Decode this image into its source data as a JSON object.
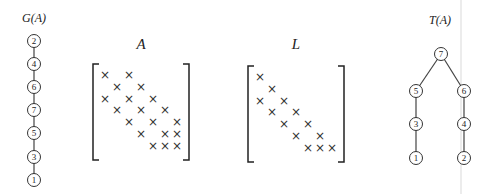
{
  "graph_g": {
    "title": "G(A)",
    "nodes": [
      {
        "id": "2",
        "x": 34,
        "y": 41
      },
      {
        "id": "4",
        "x": 34,
        "y": 64
      },
      {
        "id": "6",
        "x": 34,
        "y": 87
      },
      {
        "id": "7",
        "x": 34,
        "y": 110
      },
      {
        "id": "5",
        "x": 34,
        "y": 133
      },
      {
        "id": "3",
        "x": 34,
        "y": 157
      },
      {
        "id": "1",
        "x": 34,
        "y": 180
      }
    ],
    "edges": [
      [
        "2",
        "4"
      ],
      [
        "4",
        "6"
      ],
      [
        "6",
        "7"
      ],
      [
        "7",
        "5"
      ],
      [
        "5",
        "3"
      ],
      [
        "3",
        "1"
      ]
    ]
  },
  "matrix_a": {
    "title": "A",
    "size": 7,
    "origin": {
      "x": 105,
      "y": 75
    },
    "step": {
      "x": 12,
      "y": 11.8
    },
    "bracket": {
      "left": 93,
      "right": 189,
      "top": 64,
      "bottom": 160
    },
    "pattern": [
      [
        1,
        3
      ],
      [
        2,
        4
      ],
      [
        1,
        3,
        5
      ],
      [
        2,
        4,
        6
      ],
      [
        3,
        5,
        7
      ],
      [
        4,
        6,
        7
      ],
      [
        5,
        6,
        7
      ]
    ],
    "symbol": "×"
  },
  "matrix_l": {
    "title": "L",
    "size": 7,
    "origin": {
      "x": 260,
      "y": 77
    },
    "step": {
      "x": 12,
      "y": 11.8
    },
    "bracket": {
      "left": 248,
      "right": 344,
      "top": 66,
      "bottom": 162
    },
    "pattern": [
      [
        1
      ],
      [
        2
      ],
      [
        1,
        3
      ],
      [
        2,
        4
      ],
      [
        3,
        5
      ],
      [
        4,
        6
      ],
      [
        5,
        6,
        7
      ]
    ],
    "symbol": "×"
  },
  "tree_t": {
    "title": "T(A)",
    "nodes": [
      {
        "id": "7",
        "x": 441,
        "y": 54
      },
      {
        "id": "5",
        "x": 416,
        "y": 91
      },
      {
        "id": "6",
        "x": 464,
        "y": 91
      },
      {
        "id": "3",
        "x": 416,
        "y": 124
      },
      {
        "id": "4",
        "x": 464,
        "y": 124
      },
      {
        "id": "1",
        "x": 416,
        "y": 158
      },
      {
        "id": "2",
        "x": 464,
        "y": 158
      }
    ],
    "edges": [
      [
        "7",
        "5"
      ],
      [
        "7",
        "6"
      ],
      [
        "5",
        "3"
      ],
      [
        "3",
        "1"
      ],
      [
        "6",
        "4"
      ],
      [
        "4",
        "2"
      ]
    ]
  },
  "labels": {
    "g_title": "G(A)",
    "a_title": "A",
    "l_title": "L",
    "t_title": "T(A)"
  },
  "colors": {
    "ink": "#222222",
    "edge": "#444444",
    "guide": "#e4e4e4"
  }
}
